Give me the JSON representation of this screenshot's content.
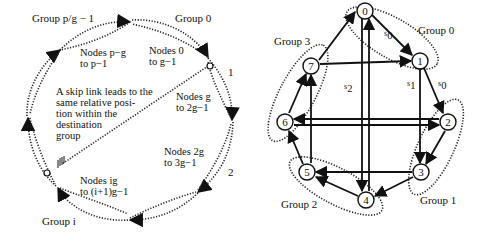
{
  "left_diagram": {
    "groups": [
      {
        "label": "Group p/g − 1",
        "nodes_line1": "Nodes p−g",
        "nodes_line2": "to p−1"
      },
      {
        "label": "Group 0",
        "nodes_line1": "Nodes 0",
        "nodes_line2": "to g−1"
      },
      {
        "label": "1",
        "nodes_line1": "Nodes g",
        "nodes_line2": "to 2g−1"
      },
      {
        "label": "2",
        "nodes_line1": "Nodes 2g",
        "nodes_line2": "to 3g−1"
      },
      {
        "label": "Group i",
        "nodes_line1": "Nodes ig",
        "nodes_line2": "to (i+1)g−1"
      }
    ],
    "annotation": [
      "A skip link leads to the",
      "same relative posi-",
      "tion within the",
      "destination",
      "group"
    ]
  },
  "right_diagram": {
    "nodes": [
      "0",
      "1",
      "2",
      "3",
      "4",
      "5",
      "6",
      "7"
    ],
    "groups": [
      "Group 0",
      "Group 1",
      "Group 2",
      "Group 3"
    ],
    "edge_labels": {
      "s0_a": "s",
      "s0_a_sub": "0",
      "s0_b": "s",
      "s0_b_sub": "0",
      "s1": "s",
      "s1_sub": "1",
      "s2": "s",
      "s2_sub": "2"
    }
  }
}
